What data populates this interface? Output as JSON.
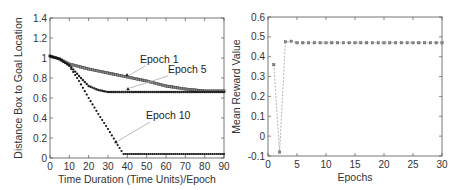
{
  "chart_data": [
    {
      "type": "line",
      "title": "",
      "xlabel": "Time Duration (Time Units)/Epoch",
      "ylabel": "Distance Box  to Goal Location",
      "xlim": [
        0,
        90
      ],
      "ylim": [
        0,
        1.4
      ],
      "xticks": [
        0,
        10,
        20,
        30,
        40,
        50,
        60,
        70,
        80,
        90
      ],
      "yticks": [
        0,
        0.2,
        0.4,
        0.6,
        0.8,
        1,
        1.2,
        1.4
      ],
      "ytick_labels": [
        "0",
        "0.2",
        "0.4",
        "0.6",
        "0.8",
        "1",
        "1.2",
        "1.4"
      ],
      "grid": false,
      "legend": "inline annotations",
      "series": [
        {
          "name": "Epoch 1",
          "x": [
            0,
            5,
            10,
            20,
            30,
            40,
            50,
            60,
            70,
            80,
            90
          ],
          "values": [
            1.02,
            0.99,
            0.94,
            0.89,
            0.85,
            0.81,
            0.77,
            0.72,
            0.69,
            0.67,
            0.67
          ]
        },
        {
          "name": "Epoch 5",
          "x": [
            0,
            5,
            10,
            15,
            20,
            25,
            30,
            35,
            40,
            50,
            60,
            70,
            80,
            90
          ],
          "values": [
            1.02,
            0.99,
            0.93,
            0.82,
            0.72,
            0.68,
            0.66,
            0.66,
            0.66,
            0.66,
            0.66,
            0.66,
            0.66,
            0.66
          ]
        },
        {
          "name": "Epoch 10",
          "x": [
            0,
            5,
            10,
            15,
            20,
            25,
            30,
            35,
            38,
            40,
            50,
            60,
            70,
            80,
            90
          ],
          "values": [
            1.02,
            0.99,
            0.92,
            0.77,
            0.6,
            0.44,
            0.29,
            0.13,
            0.04,
            0.04,
            0.04,
            0.04,
            0.04,
            0.04,
            0.04
          ]
        }
      ],
      "annotations": [
        {
          "text": "Epoch 1",
          "x": 45,
          "y": 0.93
        },
        {
          "text": "Epoch 5",
          "x": 55,
          "y": 0.87
        },
        {
          "text": "Epoch 10",
          "x": 50,
          "y": 0.43
        }
      ]
    },
    {
      "type": "line",
      "title": "",
      "xlabel": "Epochs",
      "ylabel": "Mean Reward Value",
      "xlim": [
        0,
        30
      ],
      "ylim": [
        -0.1,
        0.6
      ],
      "xticks": [
        0,
        5,
        10,
        15,
        20,
        25,
        30
      ],
      "yticks": [
        -0.1,
        0,
        0.1,
        0.2,
        0.3,
        0.4,
        0.5,
        0.6
      ],
      "ytick_labels": [
        "-0.1",
        "0",
        "0.1",
        "0.2",
        "0.3",
        "0.4",
        "0.5",
        "0.6"
      ],
      "grid": false,
      "line_style": "dashed with markers",
      "series": [
        {
          "name": "Mean Reward",
          "x": [
            1,
            2,
            3,
            4,
            5,
            6,
            7,
            8,
            9,
            10,
            11,
            12,
            13,
            14,
            15,
            16,
            17,
            18,
            19,
            20,
            21,
            22,
            23,
            24,
            25,
            26,
            27,
            28,
            29,
            30
          ],
          "values": [
            0.36,
            -0.08,
            0.475,
            0.478,
            0.47,
            0.47,
            0.47,
            0.47,
            0.47,
            0.47,
            0.47,
            0.47,
            0.47,
            0.47,
            0.47,
            0.47,
            0.47,
            0.47,
            0.47,
            0.47,
            0.47,
            0.47,
            0.47,
            0.47,
            0.47,
            0.47,
            0.47,
            0.47,
            0.47,
            0.47
          ]
        }
      ]
    }
  ]
}
